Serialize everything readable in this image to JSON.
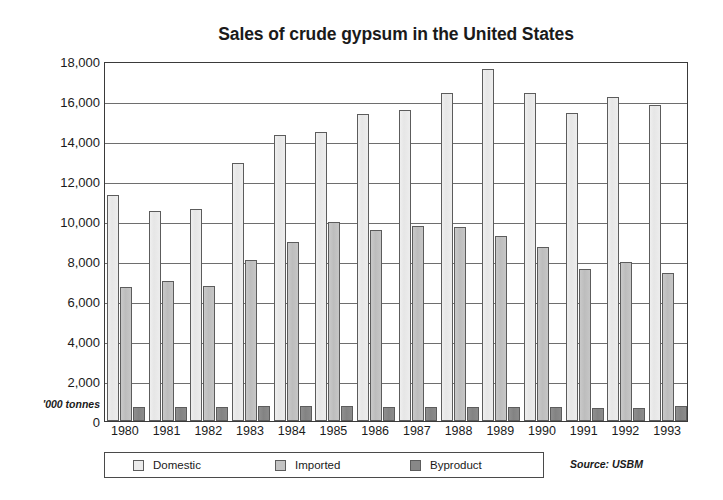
{
  "chart_data": {
    "type": "bar",
    "title": "Sales of crude gypsum in the United States",
    "xlabel": "",
    "ylabel": "'000 tonnes",
    "ylim": [
      0,
      18000
    ],
    "ytick_values": [
      0,
      2000,
      4000,
      6000,
      8000,
      10000,
      12000,
      14000,
      16000,
      18000
    ],
    "ytick_labels": [
      "0",
      "2,000",
      "4,000",
      "6,000",
      "8,000",
      "10,000",
      "12,000",
      "14,000",
      "16,000",
      "18,000"
    ],
    "grid": true,
    "legend_position": "below-left",
    "categories": [
      "1980",
      "1981",
      "1982",
      "1983",
      "1984",
      "1985",
      "1986",
      "1987",
      "1988",
      "1989",
      "1990",
      "1991",
      "1992",
      "1993"
    ],
    "series": [
      {
        "name": "Domestic",
        "color": "#ebebeb",
        "values": [
          11300,
          10500,
          10600,
          12900,
          14300,
          14450,
          15350,
          15550,
          16400,
          17600,
          16400,
          15400,
          16200,
          15800
        ]
      },
      {
        "name": "Imported",
        "color": "#c3c3c3",
        "values": [
          6700,
          7000,
          6750,
          8050,
          8950,
          9950,
          9550,
          9750,
          9700,
          9250,
          8700,
          7600,
          7950,
          7400
        ]
      },
      {
        "name": "Byproduct",
        "color": "#888888",
        "values": [
          700,
          700,
          720,
          750,
          730,
          760,
          700,
          700,
          680,
          700,
          720,
          650,
          640,
          760
        ]
      }
    ],
    "annotations": [
      {
        "name": "source",
        "text": "Source: USBM"
      }
    ]
  }
}
